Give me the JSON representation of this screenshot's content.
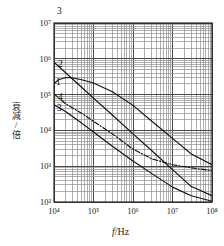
{
  "axes": {
    "x_label_var": "f",
    "x_label_unit": "/Hz",
    "y_label": "衰减/倍",
    "x_ticks": [
      "10⁴",
      "10⁵",
      "10⁶",
      "10⁷",
      "10⁸"
    ],
    "y_ticks": [
      "10²",
      "10³",
      "10⁴",
      "10⁵",
      "10⁶",
      "10⁷"
    ]
  },
  "annotations": {
    "top": "3",
    "left_stack": [
      "2",
      "1",
      "4",
      "3"
    ]
  },
  "colors": {
    "grid_major": "#4a4a4a",
    "grid_minor": "#8f8f8f",
    "frame": "#1a1a1a",
    "curve": "#111111",
    "text": "#1e1e1e"
  },
  "chart_data": {
    "type": "line",
    "title": "",
    "xlabel": "f/Hz",
    "ylabel": "衰减/倍",
    "xscale": "log",
    "yscale": "log",
    "xlim": [
      10000,
      100000000
    ],
    "ylim": [
      100,
      10000000
    ],
    "grid": true,
    "grid_minor": true,
    "legend": "inline-numeric-labels",
    "xtick_values": [
      10000,
      100000,
      1000000,
      10000000,
      100000000
    ],
    "ytick_values": [
      100,
      1000,
      10000,
      100000,
      1000000,
      10000000
    ],
    "series": [
      {
        "name": "2",
        "label": "2",
        "style": "solid",
        "x": [
          10000,
          20000,
          50000,
          100000,
          300000,
          1000000,
          3000000,
          10000000,
          30000000,
          100000000
        ],
        "y": [
          800000,
          400000,
          160000,
          80000,
          27000,
          8000,
          2700,
          800,
          270,
          150
        ]
      },
      {
        "name": "1",
        "label": "1",
        "style": "solid",
        "x": [
          10000,
          13000,
          20000,
          30000,
          50000,
          100000,
          300000,
          1000000,
          3000000,
          10000000,
          30000000,
          100000000
        ],
        "y": [
          200000,
          260000,
          300000,
          290000,
          260000,
          210000,
          120000,
          50000,
          18000,
          6000,
          2200,
          1100
        ]
      },
      {
        "name": "4",
        "label": "4",
        "style": "dashdot",
        "x": [
          10000,
          20000,
          50000,
          100000,
          300000,
          1000000,
          3000000,
          10000000,
          30000000,
          100000000
        ],
        "y": [
          105000,
          55000,
          30000,
          18000,
          8000,
          3000,
          1600,
          1100,
          900,
          750
        ]
      },
      {
        "name": "3",
        "label": "3",
        "style": "solid",
        "x": [
          10000,
          20000,
          50000,
          100000,
          300000,
          1000000,
          3000000,
          10000000,
          30000000,
          100000000
        ],
        "y": [
          52000,
          33000,
          16000,
          9000,
          3600,
          1400,
          620,
          260,
          150,
          105
        ]
      }
    ]
  }
}
